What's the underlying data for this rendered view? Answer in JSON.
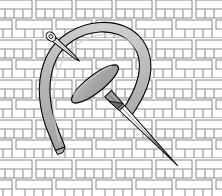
{
  "figure": {
    "type": "technical-line-illustration",
    "canvas": {
      "width": 222,
      "height": 196
    },
    "background_color": "#ffffff"
  },
  "palette": {
    "background": "#ffffff",
    "fabric_line": "#8a8a8a",
    "fabric_fill": "#ffffff",
    "outline": "#000000",
    "thread_fill": "#b3b3b3",
    "thread_highlight": "#c9c9c9",
    "needle_fill": "#ffffff",
    "needle_shadow": "#a8a8a8",
    "needle_eye_dark": "#6e6e6e",
    "shuttle_fill": "#a6a6a6"
  },
  "fabric": {
    "name": "basketweave-fabric-grid",
    "description": "Running-bond / basketweave weave of rectangular strips",
    "brick_width": 40,
    "brick_height": 10,
    "row_height": 20,
    "column_width": 40,
    "stroke_width": 1,
    "rows": 10,
    "columns": 6
  },
  "thread": {
    "name": "suture-thread-loop",
    "shape": "inverted-u-horseshoe",
    "stroke_width": 1,
    "band_width": 11,
    "fill": "#b3b3b3",
    "left_tip": {
      "x": 55,
      "y": 150
    },
    "apex": {
      "x": 112,
      "y": 23
    },
    "right_tip": {
      "x": 131,
      "y": 116
    }
  },
  "shuttle": {
    "name": "center-shuttle-oval",
    "shape": "elongated-ellipse",
    "center": {
      "x": 95,
      "y": 84
    },
    "length": 58,
    "thickness": 17,
    "rotation_deg": -38,
    "fill": "#a6a6a6"
  },
  "needle_main": {
    "name": "main-needle",
    "head": {
      "x": 122,
      "y": 108
    },
    "tip": {
      "x": 178,
      "y": 166
    },
    "length": 80,
    "width": 7,
    "has_eye": true,
    "eye_fill": "#6e6e6e"
  },
  "needle_pin": {
    "name": "upper-left-pin",
    "head": {
      "x": 49,
      "y": 35
    },
    "tip": {
      "x": 77,
      "y": 59
    },
    "length": 37,
    "width": 5,
    "has_eye": true
  },
  "labels": {
    "figure_caption": "",
    "annotations": []
  }
}
